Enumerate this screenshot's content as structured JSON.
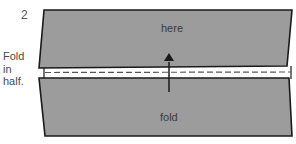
{
  "diagram": {
    "step_number": "2",
    "instruction_lines": [
      "Fold",
      "in",
      "half."
    ],
    "top_flap_label": "here",
    "bottom_flap_label": "fold",
    "arrow": "fold-up-arrow",
    "colors": {
      "paper": "#9c9c9c",
      "outline": "#1a1a1a",
      "background": "#ffffff",
      "fold_line": "#555555"
    }
  }
}
